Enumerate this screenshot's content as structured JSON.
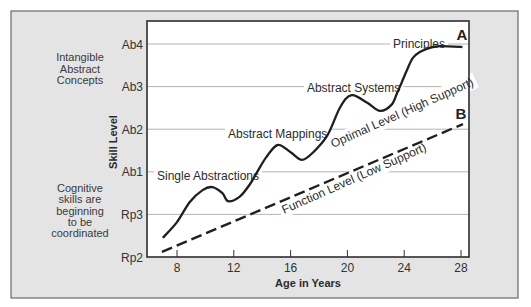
{
  "chart_data": {
    "type": "line",
    "title": "",
    "xlabel": "Age in Years",
    "ylabel": "Skill Level",
    "x_ticks": [
      8,
      12,
      16,
      20,
      24,
      28
    ],
    "y_ticks": [
      "Rp2",
      "Rp3",
      "Ab1",
      "Ab2",
      "Ab3",
      "Ab4"
    ],
    "y_tick_note": "y values expressed as level index: Rp2=0, Rp3=1, Ab1=2, Ab2=3, Ab3=4, Ab4=5",
    "xlim": [
      5.9,
      28.6
    ],
    "ylim": [
      0,
      5.54
    ],
    "grid": true,
    "series": [
      {
        "name": "Optimal Level (High Support)",
        "marker_label": "A",
        "style": "solid",
        "points": [
          [
            7.0,
            0.45
          ],
          [
            8.0,
            0.82
          ],
          [
            8.9,
            1.29
          ],
          [
            9.8,
            1.57
          ],
          [
            10.5,
            1.64
          ],
          [
            11.2,
            1.5
          ],
          [
            11.6,
            1.31
          ],
          [
            12.4,
            1.41
          ],
          [
            13.1,
            1.69
          ],
          [
            13.6,
            1.97
          ],
          [
            14.3,
            2.35
          ],
          [
            15.1,
            2.63
          ],
          [
            16.0,
            2.46
          ],
          [
            16.8,
            2.28
          ],
          [
            17.6,
            2.46
          ],
          [
            18.6,
            2.86
          ],
          [
            19.5,
            3.52
          ],
          [
            20.3,
            3.8
          ],
          [
            21.4,
            3.62
          ],
          [
            22.3,
            3.43
          ],
          [
            23.1,
            3.57
          ],
          [
            23.5,
            3.85
          ],
          [
            23.8,
            4.08
          ],
          [
            24.2,
            4.39
          ],
          [
            24.6,
            4.67
          ],
          [
            25.1,
            4.81
          ],
          [
            25.8,
            4.91
          ],
          [
            26.5,
            4.95
          ],
          [
            28.1,
            4.93
          ]
        ]
      },
      {
        "name": "Function Level (Low Support)",
        "marker_label": "B",
        "style": "dashed",
        "points": [
          [
            6.94,
            0.12
          ],
          [
            28.14,
            3.12
          ]
        ]
      }
    ],
    "annotations": [
      {
        "text": "Single Abstractions",
        "x": 6.59,
        "y": 1.92,
        "rotate": 0
      },
      {
        "text": "Abstract Mappings",
        "x": 11.59,
        "y": 2.91,
        "rotate": 0
      },
      {
        "text": "Abstract Systems",
        "x": 17.15,
        "y": 3.99,
        "rotate": 0
      },
      {
        "text": "Principles",
        "x": 23.21,
        "y": 5.02,
        "rotate": 0
      },
      {
        "text": "Optimal Level (High Support)",
        "x": 18.99,
        "y": 2.56,
        "rotate": -24,
        "baseline": true
      },
      {
        "text": "Function Level (Low Support)",
        "x": 15.54,
        "y": 1.01,
        "rotate": -24,
        "baseline": true
      }
    ],
    "markers": [
      {
        "text": "A",
        "x": 28.07,
        "y": 5.21
      },
      {
        "text": "B",
        "x": 28.0,
        "y": 3.36
      }
    ]
  },
  "side_notes": {
    "upper": [
      "Intangible",
      "Abstract",
      "Concepts"
    ],
    "lower": [
      "Cognitive",
      "skills are",
      "beginning",
      "to be",
      "coordinated"
    ]
  },
  "colors": {
    "panel_bg": "#e4e4e4",
    "panel_border": "#6a6a6a",
    "plot_bg": "#ffffff",
    "plot_border": "#2e2e2e",
    "gridline": "#b4b4b4",
    "series": "#1f1f1f"
  }
}
